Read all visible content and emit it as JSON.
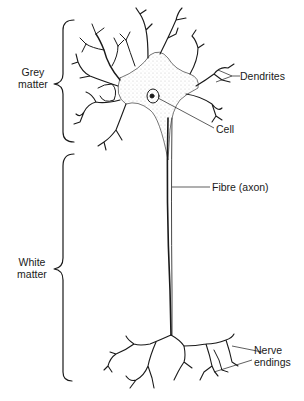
{
  "diagram": {
    "regions": [
      {
        "label_line1": "Grey",
        "label_line2": "matter"
      },
      {
        "label_line1": "White",
        "label_line2": "matter"
      }
    ],
    "parts": {
      "dendrites": "Dendrites",
      "cell": "Cell",
      "fibre": "Fibre (axon)",
      "nerve_endings_line1": "Nerve",
      "nerve_endings_line2": "endings"
    },
    "colors": {
      "ink": "#1a1a1a",
      "background": "#ffffff",
      "cytoplasm": "#d9d9d9"
    }
  }
}
